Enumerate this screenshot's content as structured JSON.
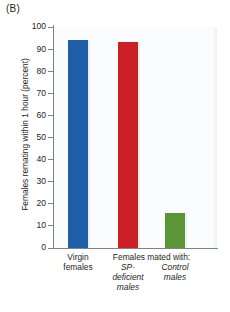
{
  "panel": {
    "label": "(B)"
  },
  "chart_data": {
    "type": "bar",
    "title": "",
    "xlabel": "",
    "ylabel": "Females remating within 1 hour (percent)",
    "ylim": [
      0,
      100
    ],
    "ytick_labels": [
      "100",
      "90",
      "80",
      "70",
      "60",
      "50",
      "40",
      "30",
      "20",
      "10",
      "0"
    ],
    "ytick_values": [
      100,
      90,
      80,
      70,
      60,
      50,
      40,
      30,
      20,
      10,
      0
    ],
    "grid": false,
    "legend": "none",
    "categories": [
      "Virgin females",
      "SP-deficient males",
      "Control males"
    ],
    "values": [
      94,
      93,
      16
    ],
    "colors": [
      "#1f5fa8",
      "#cc1f26",
      "#5a9635"
    ],
    "group_header": "Females mated with:",
    "group_header_members": [
      "SP-deficient males",
      "Control males"
    ]
  },
  "axis": {
    "x_labels": [
      {
        "line1": "Virgin",
        "line2": "females",
        "line3": "",
        "italic": false
      },
      {
        "line1": "SP-",
        "line2": "deficient",
        "line3": "males",
        "italic": true
      },
      {
        "line1": "Control",
        "line2": "males",
        "line3": "",
        "italic": true
      }
    ]
  }
}
